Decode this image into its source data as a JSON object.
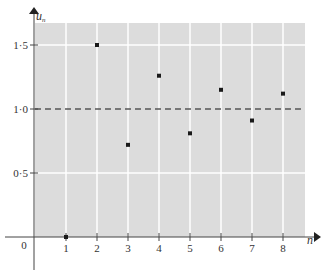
{
  "chart_data": {
    "type": "scatter",
    "title": "",
    "xlabel": "n",
    "ylabel": "u_n",
    "ylabel_main": "u",
    "ylabel_sub": "n",
    "x": [
      1,
      2,
      3,
      4,
      5,
      6,
      7,
      8
    ],
    "series": [
      {
        "name": "u_n",
        "values": [
          0,
          1.5,
          0.72,
          1.26,
          0.81,
          1.15,
          0.91,
          1.12
        ]
      }
    ],
    "reference_line": {
      "y": 1.0,
      "style": "dashed"
    },
    "xlim": [
      0,
      8.7
    ],
    "ylim": [
      0,
      1.68
    ],
    "x_ticks": [
      "1",
      "2",
      "3",
      "4",
      "5",
      "6",
      "7",
      "8"
    ],
    "y_ticks": [
      "0·5",
      "1·0",
      "1·5"
    ],
    "y_tick_values": [
      0.5,
      1.0,
      1.5
    ],
    "origin_label": "0",
    "grid": true,
    "colors": {
      "plot_background": "#dcdcdc",
      "grid": "#ffffff",
      "axis": "#444444",
      "points": "#1a1a1a",
      "dashed": "#555555"
    }
  }
}
